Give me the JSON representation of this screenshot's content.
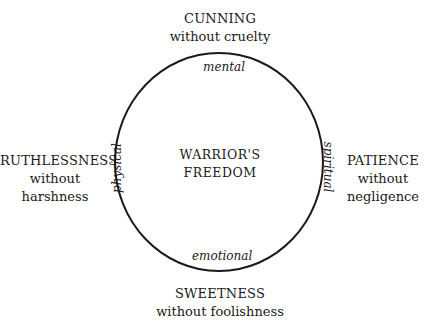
{
  "diagram": {
    "center": {
      "line1": "WARRIOR'S",
      "line2": "FREEDOM"
    },
    "axes": {
      "top": "mental",
      "bottom": "emotional",
      "left": "physical",
      "right": "spiritual"
    },
    "qualities": {
      "top": {
        "title": "CUNNING",
        "line1": "without cruelty"
      },
      "bottom": {
        "title": "SWEETNESS",
        "line1": "without foolishness"
      },
      "left": {
        "title": "RUTHLESSNESS",
        "line1": "without",
        "line2": "harshness"
      },
      "right": {
        "title": "PATIENCE",
        "line1": "without",
        "line2": "negligence"
      }
    },
    "colors": {
      "ink": "#1a1a1a",
      "background": "#ffffff"
    }
  }
}
